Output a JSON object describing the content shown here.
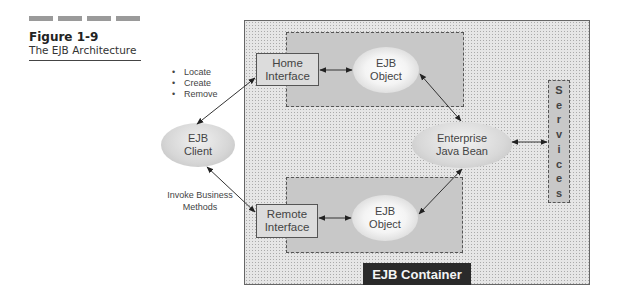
{
  "figure": {
    "number": "Figure 1-9",
    "caption": "The EJB Architecture",
    "header_bars": 4
  },
  "diagram": {
    "container_label": "EJB Container",
    "client": {
      "line1": "EJB",
      "line2": "Client"
    },
    "client_methods": [
      "Locate",
      "Create",
      "Remove"
    ],
    "business_note": {
      "line1": "Invoke Business",
      "line2": "Methods"
    },
    "home_interface": {
      "line1": "Home",
      "line2": "Interface"
    },
    "remote_interface": {
      "line1": "Remote",
      "line2": "Interface"
    },
    "home_ejb_object": {
      "line1": "EJB",
      "line2": "Object"
    },
    "remote_ejb_object": {
      "line1": "EJB",
      "line2": "Object"
    },
    "enterprise_bean": {
      "line1": "Enterprise",
      "line2": "Java Bean"
    },
    "services": {
      "letters": [
        "S",
        "e",
        "r",
        "v",
        "i",
        "c",
        "e",
        "s"
      ],
      "label": "Services"
    }
  },
  "colors": {
    "container_bg": "#e6e6e6",
    "region_bg": "#c8c8c8",
    "label_bg": "#2a2a2a",
    "label_fg": "#f4f4f4"
  }
}
